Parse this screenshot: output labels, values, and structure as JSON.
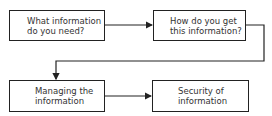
{
  "diagram": {
    "nodes": [
      {
        "id": "need",
        "label": "What information\ndo you need?"
      },
      {
        "id": "get",
        "label": "How do you get\nthis information?"
      },
      {
        "id": "manage",
        "label": "Managing the\ninformation"
      },
      {
        "id": "security",
        "label": "Security of\ninformation"
      }
    ],
    "edges": [
      {
        "from": "need",
        "to": "get"
      },
      {
        "from": "get",
        "to": "manage"
      },
      {
        "from": "manage",
        "to": "security"
      }
    ]
  }
}
